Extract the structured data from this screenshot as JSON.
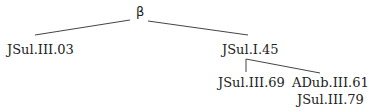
{
  "tree": {
    "root": "β",
    "left_leaf": "JSul.III.03",
    "right_node": "JSul.I.45",
    "right_children": {
      "left": "JSul.III.69",
      "right_line1": "ADub.III.61",
      "right_line2": "JSul.III.79"
    }
  },
  "colors": {
    "line": "#444444",
    "text": "#222222",
    "background": "#ffffff"
  }
}
